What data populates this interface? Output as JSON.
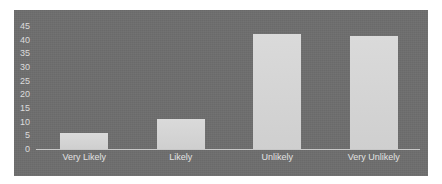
{
  "chart_data": {
    "type": "bar",
    "title": "",
    "xlabel": "",
    "ylabel": "",
    "categories": [
      "Very Likely",
      "Likely",
      "Unlikely",
      "Very Unlikely"
    ],
    "values": [
      6,
      11,
      42,
      41.5
    ],
    "ylim": [
      0,
      45
    ],
    "yticks": [
      "0",
      "5",
      "10",
      "15",
      "20",
      "25",
      "30",
      "35",
      "40",
      "45"
    ],
    "grid": false,
    "legend": "none",
    "colors": {
      "background": "#6e6e6e",
      "bar": "#d6d6d6",
      "text": "#dcdcdc"
    }
  }
}
